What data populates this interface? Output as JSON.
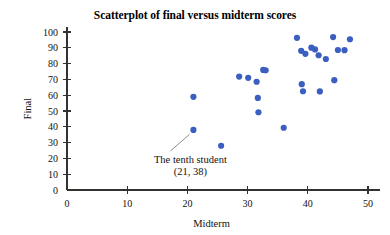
{
  "chart_data": {
    "type": "scatter",
    "title": "Scatterplot of final versus midterm scores",
    "xlabel": "Midterm",
    "ylabel": "Final",
    "xlim": [
      0,
      52
    ],
    "ylim": [
      0,
      103
    ],
    "xticks": [
      0,
      10,
      20,
      30,
      40,
      50
    ],
    "xtick_labels": [
      "0",
      "10",
      "20",
      "30",
      "40",
      "50"
    ],
    "yticks": [
      0,
      10,
      20,
      30,
      40,
      50,
      60,
      70,
      80,
      90,
      100
    ],
    "ytick_labels": [
      "0",
      "10",
      "20",
      "30",
      "40",
      "50",
      "60",
      "70",
      "80",
      "90",
      "100"
    ],
    "grid": false,
    "legend": false,
    "marker_color": "#3b5fc0",
    "marker_size": 3.1,
    "points": [
      {
        "x": 21.0,
        "y": 59.0
      },
      {
        "x": 21.0,
        "y": 38.0
      },
      {
        "x": 25.6,
        "y": 28.0
      },
      {
        "x": 28.6,
        "y": 71.8
      },
      {
        "x": 30.1,
        "y": 71.0
      },
      {
        "x": 31.5,
        "y": 68.5
      },
      {
        "x": 31.7,
        "y": 58.3
      },
      {
        "x": 31.8,
        "y": 49.2
      },
      {
        "x": 32.6,
        "y": 76.0
      },
      {
        "x": 33.0,
        "y": 75.8
      },
      {
        "x": 36.0,
        "y": 39.4
      },
      {
        "x": 38.2,
        "y": 96.3
      },
      {
        "x": 38.9,
        "y": 88.1
      },
      {
        "x": 39.0,
        "y": 67.0
      },
      {
        "x": 39.2,
        "y": 62.5
      },
      {
        "x": 39.6,
        "y": 86.2
      },
      {
        "x": 40.6,
        "y": 90.1
      },
      {
        "x": 41.2,
        "y": 89.0
      },
      {
        "x": 41.8,
        "y": 85.3
      },
      {
        "x": 42.0,
        "y": 62.4
      },
      {
        "x": 43.0,
        "y": 82.9
      },
      {
        "x": 44.2,
        "y": 96.8
      },
      {
        "x": 44.4,
        "y": 69.5
      },
      {
        "x": 45.0,
        "y": 88.6
      },
      {
        "x": 46.1,
        "y": 88.5
      },
      {
        "x": 47.0,
        "y": 95.4
      }
    ],
    "annotation": {
      "line1": "The tenth student",
      "line2": "(21, 38)",
      "target_x": 21.0,
      "target_y": 38.0
    }
  }
}
